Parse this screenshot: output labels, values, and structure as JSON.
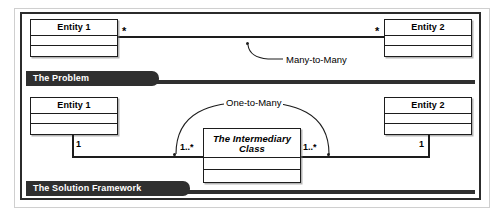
{
  "figure": {
    "type": "uml-class-diagram"
  },
  "problem": {
    "banner_label": "The Problem",
    "left_entity": {
      "name": "Entity 1",
      "compartments": [
        "",
        ""
      ]
    },
    "right_entity": {
      "name": "Entity 2",
      "compartments": [
        "",
        ""
      ]
    },
    "association": {
      "label": "Many-to-Many",
      "left_multiplicity": "*",
      "right_multiplicity": "*"
    }
  },
  "solution": {
    "banner_label": "The Solution Framework",
    "left_entity": {
      "name": "Entity 1",
      "compartments": [
        "",
        ""
      ]
    },
    "right_entity": {
      "name": "Entity 2",
      "compartments": [
        "",
        ""
      ]
    },
    "intermediary": {
      "name_line1": "The Intermediary",
      "name_line2": "Class",
      "compartments": [
        "",
        ""
      ]
    },
    "arc_label": "One-to-Many",
    "multiplicities": {
      "left_entity_end": "1",
      "left_inter_end": "1..*",
      "right_inter_end": "1..*",
      "right_entity_end": "1"
    }
  },
  "colors": {
    "line": "#1d1d1d",
    "banner": "#2f2f2f",
    "banner_text": "#ffffff",
    "frame": "#2b2b2b",
    "page": "#ffffff"
  }
}
